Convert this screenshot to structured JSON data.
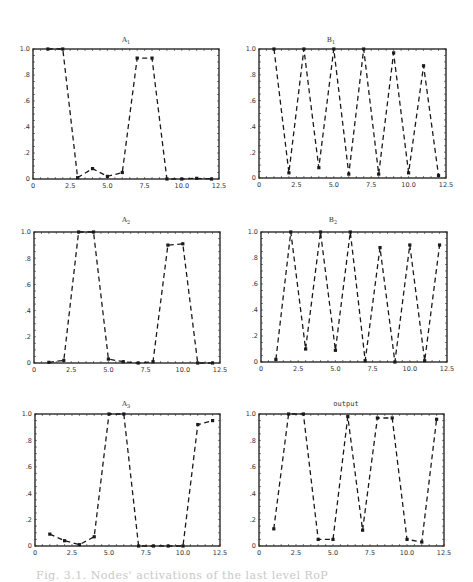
{
  "figure": {
    "caption": "Fig. 3.1. Nodes' activations of the last level RoP"
  },
  "chart_data": [
    {
      "id": "A1",
      "type": "line",
      "title": "A",
      "title_sub": "1",
      "x": [
        1,
        2,
        3,
        4,
        5,
        6,
        7,
        8,
        9,
        10,
        11,
        12
      ],
      "values": [
        1.0,
        1.0,
        0.01,
        0.08,
        0.02,
        0.05,
        0.93,
        0.93,
        0.0,
        0.0,
        0.005,
        0.0
      ],
      "xlim": [
        0,
        12.5
      ],
      "ylim": [
        0,
        1.0
      ],
      "xticks": [
        "0",
        "2.5",
        "5.0",
        "7.5",
        "10.0",
        "12.5"
      ],
      "yticks": [
        "0",
        ".2",
        ".4",
        ".6",
        ".8",
        "1.0"
      ],
      "style": "dashed line with square markers",
      "grid": false,
      "legend": null
    },
    {
      "id": "B1",
      "type": "line",
      "title": "B",
      "title_sub": "1",
      "x": [
        1,
        2,
        3,
        4,
        5,
        6,
        7,
        8,
        9,
        10,
        11,
        12
      ],
      "values": [
        1.0,
        0.04,
        1.0,
        0.08,
        1.0,
        0.03,
        1.0,
        0.03,
        0.97,
        0.04,
        0.87,
        0.02
      ],
      "xlim": [
        0,
        12.5
      ],
      "ylim": [
        0,
        1.0
      ],
      "xticks": [
        "0",
        "2.5",
        "5.0",
        "7.5",
        "10.0",
        "12.5"
      ],
      "yticks": [
        "0",
        ".2",
        ".4",
        ".6",
        ".8",
        "1.0"
      ],
      "style": "dashed line with square markers",
      "grid": false,
      "legend": null
    },
    {
      "id": "A2",
      "type": "line",
      "title": "A",
      "title_sub": "2",
      "x": [
        1,
        2,
        3,
        4,
        5,
        6,
        7,
        8,
        9,
        10,
        11,
        12
      ],
      "values": [
        0.005,
        0.02,
        1.0,
        1.0,
        0.03,
        0.01,
        0.0,
        0.01,
        0.9,
        0.91,
        0.0,
        0.0
      ],
      "xlim": [
        0,
        12.5
      ],
      "ylim": [
        0,
        1.0
      ],
      "xticks": [
        "0",
        "2.5",
        "5.0",
        "7.5",
        "10.0",
        "12.5"
      ],
      "yticks": [
        "0",
        ".2",
        ".4",
        ".6",
        ".8",
        "1.0"
      ],
      "style": "dashed line with square markers",
      "grid": false,
      "legend": null
    },
    {
      "id": "B2",
      "type": "line",
      "title": "B",
      "title_sub": "2",
      "x": [
        1,
        2,
        3,
        4,
        5,
        6,
        7,
        8,
        9,
        10,
        11,
        12
      ],
      "values": [
        0.02,
        1.0,
        0.1,
        1.0,
        0.09,
        1.0,
        0.01,
        0.88,
        0.0,
        0.9,
        0.01,
        0.9
      ],
      "xlim": [
        0,
        12.5
      ],
      "ylim": [
        0,
        1.0
      ],
      "xticks": [
        "0",
        "2.5",
        "5.0",
        "7.5",
        "10.0",
        "12.5"
      ],
      "yticks": [
        "0",
        ".2",
        ".4",
        ".6",
        ".8",
        "1.0"
      ],
      "style": "dashed line with square markers",
      "grid": false,
      "legend": null
    },
    {
      "id": "A3",
      "type": "line",
      "title": "A",
      "title_sub": "3",
      "x": [
        1,
        2,
        3,
        4,
        5,
        6,
        7,
        8,
        9,
        10,
        11,
        12
      ],
      "values": [
        0.09,
        0.04,
        0.01,
        0.07,
        1.0,
        1.0,
        0.0,
        0.0,
        0.0,
        0.0,
        0.92,
        0.95
      ],
      "xlim": [
        0,
        12.5
      ],
      "ylim": [
        0,
        1.0
      ],
      "xticks": [
        "0",
        "2.5",
        "5.0",
        "7.5",
        "10.0",
        "12.5"
      ],
      "yticks": [
        "0",
        ".2",
        ".4",
        ".6",
        ".8",
        "1.0"
      ],
      "style": "dashed line with square markers",
      "grid": false,
      "legend": null
    },
    {
      "id": "output",
      "type": "line",
      "title": "output",
      "title_sub": "",
      "x": [
        1,
        2,
        3,
        4,
        5,
        6,
        7,
        8,
        9,
        10,
        11,
        12
      ],
      "values": [
        0.13,
        1.0,
        1.0,
        0.05,
        0.05,
        0.98,
        0.12,
        0.97,
        0.97,
        0.05,
        0.03,
        0.96
      ],
      "xlim": [
        0,
        12.5
      ],
      "ylim": [
        0,
        1.0
      ],
      "xticks": [
        "0",
        "2.5",
        "5.0",
        "7.5",
        "10.0",
        "12.5"
      ],
      "yticks": [
        "0",
        ".2",
        ".4",
        ".6",
        ".8",
        "1.0"
      ],
      "style": "dashed line with square markers",
      "grid": false,
      "legend": null
    }
  ],
  "colors": {
    "line": "#1a1a1a",
    "frame": "#2a2a2a",
    "caption": "#c8c8c8"
  }
}
